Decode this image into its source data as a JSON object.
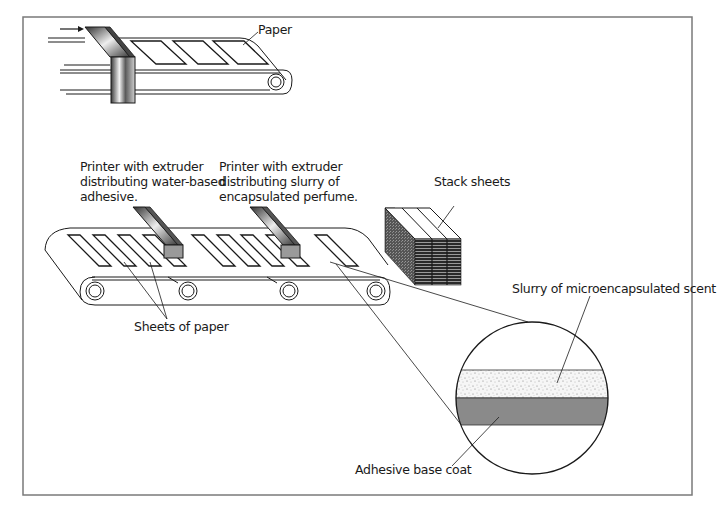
{
  "diagram": {
    "labels": {
      "paper": "Paper",
      "printer_adhesive": [
        "Printer with extruder",
        "distributing water-based",
        "adhesive."
      ],
      "printer_perfume": [
        "Printer with extruder",
        "distributing slurry of",
        "encapsulated perfume."
      ],
      "stack_sheets": "Stack sheets",
      "sheets_of_paper": "Sheets of paper",
      "slurry": "Slurry of microencapsulated scent",
      "adhesive_base": "Adhesive base coat"
    },
    "colors": {
      "frame": "#7a7a7a",
      "line": "#1a1a1a",
      "adhesive_layer": "#8a8a8a",
      "slurry_layer": "#f2f2f2",
      "extruder_face": "#9a9a9a",
      "stack_dark": "#2a2a2a"
    },
    "steps": [
      {
        "step": 1,
        "description": "Paper fed through cutter onto conveyor"
      },
      {
        "step": 2,
        "description": "Adhesive applied by extruder printer"
      },
      {
        "step": 3,
        "description": "Perfume slurry applied by extruder printer"
      },
      {
        "step": 4,
        "description": "Sheets stacked"
      }
    ],
    "cross_section_layers": [
      "Slurry of microencapsulated scent",
      "Adhesive base coat"
    ]
  }
}
